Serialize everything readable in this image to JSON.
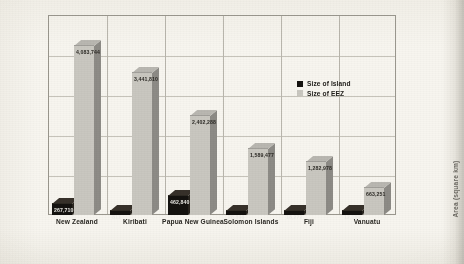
{
  "chart_data": {
    "type": "bar",
    "title": "",
    "subtitle": "",
    "xlabel": "",
    "ylabel": "Area (square km)",
    "ylim": [
      0,
      4500000
    ],
    "grid": true,
    "legend_position": "inside-top-right",
    "categories": [
      "New Zealand",
      "Kiribati",
      "Papua New Guinea",
      "Solomon Islands",
      "Fiji",
      "Vanuatu"
    ],
    "series": [
      {
        "name": "Size of Island",
        "color": "#151310",
        "values": [
          267710,
          811,
          462840,
          28896,
          18272,
          12189
        ],
        "labels": [
          "267,710",
          "811",
          "462,840",
          "28,896",
          "18,272",
          "12,189"
        ]
      },
      {
        "name": "Size of EEZ",
        "color": "#c9c7c0",
        "values": [
          4083744,
          3441810,
          2402288,
          1589477,
          1282978,
          663251
        ],
        "labels": [
          "4,083,744",
          "3,441,810",
          "2,402,288",
          "1,589,477",
          "1,282,978",
          "663,251"
        ]
      }
    ]
  },
  "legend": {
    "items": [
      {
        "label": "Size of Island",
        "swatch": "#151310"
      },
      {
        "label": "Size of EEZ",
        "swatch": "#c9c7c0"
      }
    ]
  },
  "axis": {
    "y_title": "Area (square km)"
  }
}
